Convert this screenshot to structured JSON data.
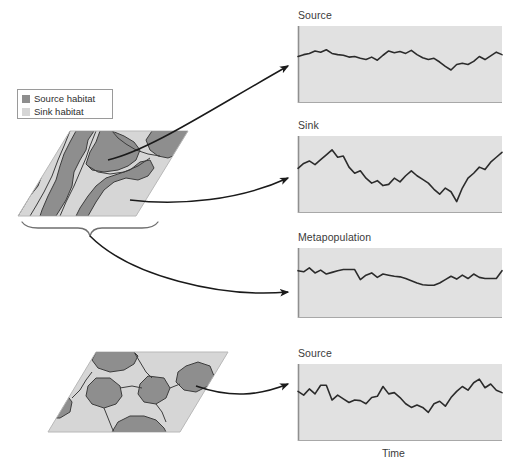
{
  "figure": {
    "caption_topic": "source-sink metapopulation dynamics"
  },
  "legend": {
    "items": [
      {
        "label": "Source habitat",
        "color": "#8e8e8e",
        "key": "source-habitat"
      },
      {
        "label": "Sink habitat",
        "color": "#d6d6d6",
        "key": "sink-habitat"
      }
    ]
  },
  "colors": {
    "source_habitat": "#8e8e8e",
    "sink_habitat": "#d6d6d6",
    "panel_fill": "#e1e1e1",
    "panel_axis": "#8f8f8f",
    "series_line": "#2b2b2b",
    "patch_outline": "#3c3c3c",
    "arrow": "#1a1a1a",
    "brace": "#6f6f6f",
    "text": "#3a3a3a"
  },
  "landscapes": [
    {
      "name": "landscape-top",
      "description": "Landscape with large contiguous source habitat patches",
      "bracket_label": ""
    },
    {
      "name": "landscape-bottom",
      "description": "Landscape with small isolated source habitat patches",
      "bracket_label": ""
    }
  ],
  "axes": {
    "x_label": "Time"
  },
  "chart_data": [
    {
      "type": "line",
      "name": "source-top",
      "title": "Source",
      "xlabel": "",
      "ylabel": "",
      "ylim": [
        0,
        100
      ],
      "grid": false,
      "legend": "none",
      "x": [
        0,
        1,
        2,
        3,
        4,
        5,
        6,
        7,
        8,
        9,
        10,
        11,
        12,
        13,
        14,
        15,
        16,
        17,
        18,
        19,
        20,
        21,
        22,
        23,
        24,
        25,
        26,
        27,
        28,
        29,
        30,
        31,
        32,
        33,
        34,
        35,
        36
      ],
      "values": [
        63,
        66,
        68,
        72,
        70,
        74,
        68,
        66,
        65,
        62,
        63,
        60,
        58,
        62,
        57,
        65,
        72,
        69,
        71,
        68,
        73,
        66,
        61,
        58,
        60,
        54,
        47,
        41,
        50,
        52,
        50,
        55,
        63,
        58,
        64,
        70,
        66
      ]
    },
    {
      "type": "line",
      "name": "sink",
      "title": "Sink",
      "xlabel": "",
      "ylabel": "",
      "ylim": [
        0,
        100
      ],
      "grid": false,
      "legend": "none",
      "x": [
        0,
        1,
        2,
        3,
        4,
        5,
        6,
        7,
        8,
        9,
        10,
        11,
        12,
        13,
        14,
        15,
        16,
        17,
        18,
        19,
        20,
        21,
        22,
        23,
        24,
        25,
        26,
        27,
        28,
        29,
        30,
        31,
        32,
        33,
        34,
        35,
        36
      ],
      "values": [
        60,
        68,
        72,
        66,
        74,
        82,
        90,
        78,
        80,
        62,
        52,
        56,
        44,
        36,
        40,
        32,
        34,
        44,
        38,
        48,
        56,
        48,
        42,
        36,
        26,
        18,
        28,
        22,
        6,
        28,
        44,
        52,
        62,
        58,
        70,
        78,
        86
      ]
    },
    {
      "type": "line",
      "name": "metapopulation",
      "title": "Metapopulation",
      "xlabel": "",
      "ylabel": "",
      "ylim": [
        0,
        100
      ],
      "grid": false,
      "legend": "none",
      "x": [
        0,
        1,
        2,
        3,
        4,
        5,
        6,
        7,
        8,
        9,
        10,
        11,
        12,
        13,
        14,
        15,
        16,
        17,
        18,
        19,
        20,
        21,
        22,
        23,
        24,
        25,
        26,
        27,
        28,
        29,
        30,
        31,
        32,
        33,
        34,
        35,
        36
      ],
      "values": [
        72,
        70,
        77,
        68,
        73,
        66,
        69,
        72,
        74,
        74,
        74,
        56,
        64,
        68,
        60,
        66,
        64,
        62,
        61,
        58,
        54,
        50,
        47,
        46,
        46,
        50,
        56,
        62,
        57,
        64,
        58,
        66,
        60,
        58,
        58,
        58,
        72
      ]
    },
    {
      "type": "line",
      "name": "source-bottom",
      "title": "Source",
      "xlabel": "Time",
      "ylabel": "",
      "ylim": [
        0,
        100
      ],
      "grid": false,
      "legend": "none",
      "x": [
        0,
        1,
        2,
        3,
        4,
        5,
        6,
        7,
        8,
        9,
        10,
        11,
        12,
        13,
        14,
        15,
        16,
        17,
        18,
        19,
        20,
        21,
        22,
        23,
        24,
        25,
        26,
        27,
        28,
        29,
        30,
        31,
        32,
        33,
        34,
        35,
        36
      ],
      "values": [
        68,
        62,
        72,
        64,
        78,
        78,
        54,
        62,
        56,
        50,
        54,
        53,
        48,
        58,
        60,
        76,
        64,
        66,
        58,
        48,
        42,
        46,
        42,
        34,
        48,
        52,
        44,
        58,
        68,
        76,
        70,
        82,
        88,
        74,
        80,
        70,
        66
      ]
    }
  ]
}
